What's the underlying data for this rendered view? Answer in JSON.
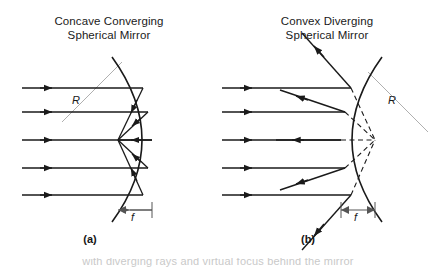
{
  "figure": {
    "type": "diagram",
    "background_color": "#ffffff",
    "ink_color": "#1a1a1a",
    "radius_line_color": "#9a9a9a"
  },
  "panels": [
    {
      "id": "a",
      "caption": "(a)",
      "title_line1": "Concave Converging",
      "title_line2": "Spherical Mirror",
      "mirror_type": "concave",
      "radius_label": "R",
      "focal_label": "f",
      "incoming_rays_y": [
        88,
        112,
        140,
        168,
        195
      ],
      "ray_start_x": 22,
      "focal_point": {
        "x": 118,
        "y": 140
      },
      "vertex": {
        "x": 152,
        "y": 140
      },
      "arc_top": {
        "x": 112,
        "y": 57
      },
      "arc_bottom": {
        "x": 112,
        "y": 222
      },
      "focal_bar": {
        "x1": 118,
        "x2": 152,
        "y": 210
      },
      "radius_line": {
        "x1": 62,
        "y1": 122,
        "x2": 122,
        "y2": 62
      }
    },
    {
      "id": "b",
      "caption": "(b)",
      "title_line1": "Convex Diverging",
      "title_line2": "Spherical Mirror",
      "mirror_type": "convex",
      "radius_label": "R",
      "focal_label": "f",
      "incoming_rays_y": [
        88,
        112,
        140,
        168,
        195
      ],
      "ray_start_x": 222,
      "virtual_focus": {
        "x": 375,
        "y": 140
      },
      "vertex": {
        "x": 341,
        "y": 140
      },
      "arc_top": {
        "x": 382,
        "y": 57
      },
      "arc_bottom": {
        "x": 382,
        "y": 222
      },
      "focal_bar": {
        "x1": 341,
        "x2": 375,
        "y": 210
      },
      "radius_line": {
        "x1": 368,
        "y1": 72,
        "x2": 428,
        "y2": 132
      }
    }
  ],
  "bottom_text": "with diverging rays and virtual focus behind the mirror"
}
